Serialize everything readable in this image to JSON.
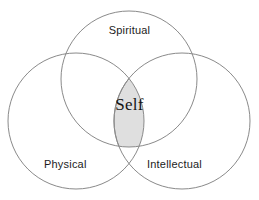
{
  "diagram": {
    "type": "venn",
    "background_color": "#ffffff",
    "stroke_color": "#8a8a8a",
    "intersection_fill": "#dfdfdf",
    "center_label": "Self",
    "circles": [
      {
        "id": "spiritual",
        "label": "Spiritual",
        "position": "top",
        "cx": 129,
        "cy": 79,
        "r": 68
      },
      {
        "id": "physical",
        "label": "Physical",
        "position": "bottom-left",
        "cx": 76,
        "cy": 121,
        "r": 68
      },
      {
        "id": "intellectual",
        "label": "Intellectual",
        "position": "bottom-right",
        "cx": 182,
        "cy": 121,
        "r": 68
      }
    ]
  }
}
